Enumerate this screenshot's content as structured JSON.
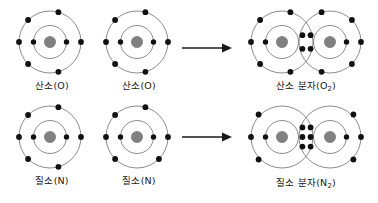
{
  "figure": {
    "background_color": "#ffffff",
    "width": 378,
    "height": 203
  },
  "style": {
    "shell_stroke": "#6e6e6e",
    "nucleus_fill": "#808080",
    "electron_fill": "#111111",
    "text_color": "#1a1a1a",
    "arrow_color": "#1a1a1a"
  },
  "rows": [
    {
      "id": "oxygen-row",
      "reactant_left": {
        "label": "산소(O)",
        "label_base": "산소(O)",
        "element_symbol": "O",
        "inner_shell_electrons": 2,
        "outer_shell_electrons": 6,
        "nucleus": "O"
      },
      "reactant_right": {
        "label": "산소(O)",
        "label_base": "산소(O)",
        "element_symbol": "O",
        "inner_shell_electrons": 2,
        "outer_shell_electrons": 6,
        "nucleus": "O"
      },
      "arrow": "→",
      "product": {
        "label_base": "산소 분자(O",
        "label_sub": "2",
        "label_tail": ")",
        "full_label": "산소 분자(O2)",
        "element_symbol": "O2",
        "shared_electrons": 4,
        "bond_type": "double bond",
        "shared_grid_cols": 2,
        "shared_grid_rows": 2
      }
    },
    {
      "id": "nitrogen-row",
      "reactant_left": {
        "label": "질소(N)",
        "label_base": "질소(N)",
        "element_symbol": "N",
        "inner_shell_electrons": 2,
        "outer_shell_electrons": 5,
        "nucleus": "N"
      },
      "reactant_right": {
        "label": "질소(N)",
        "label_base": "질소(N)",
        "element_symbol": "N",
        "inner_shell_electrons": 2,
        "outer_shell_electrons": 5,
        "nucleus": "N"
      },
      "arrow": "→",
      "product": {
        "label_base": "질소 분자(N",
        "label_sub": "2",
        "label_tail": ")",
        "full_label": "질소 분자(N2)",
        "element_symbol": "N2",
        "shared_electrons": 6,
        "bond_type": "triple bond",
        "shared_grid_cols": 2,
        "shared_grid_rows": 3
      }
    }
  ]
}
